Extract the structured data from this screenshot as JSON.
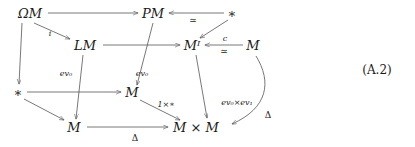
{
  "figure": {
    "kind": "commutative-diagram",
    "equation_number": "(A.2)",
    "nodes": [
      {
        "id": "omega-m",
        "label": "ΩM",
        "x": 30,
        "y": 13
      },
      {
        "id": "pm",
        "label": "PM",
        "x": 153,
        "y": 13
      },
      {
        "id": "star-top",
        "label": "∗",
        "x": 232,
        "y": 13
      },
      {
        "id": "lm",
        "label": "LM",
        "x": 85,
        "y": 45
      },
      {
        "id": "mi",
        "label": "Mᴵ",
        "x": 192,
        "y": 45
      },
      {
        "id": "m-right",
        "label": "M",
        "x": 253,
        "y": 45
      },
      {
        "id": "star-left",
        "label": "∗",
        "x": 18,
        "y": 92
      },
      {
        "id": "m-mid",
        "label": "M",
        "x": 132,
        "y": 92
      },
      {
        "id": "m-bottom",
        "label": "M",
        "x": 74,
        "y": 127
      },
      {
        "id": "m-times-m",
        "label": "M × M",
        "x": 196,
        "y": 127
      }
    ],
    "edge_labels": [
      {
        "id": "i",
        "text": "i",
        "x": 50,
        "y": 34
      },
      {
        "id": "simeq-top",
        "text": "≃",
        "x": 193,
        "y": 20
      },
      {
        "id": "c",
        "text": "c",
        "x": 225,
        "y": 39
      },
      {
        "id": "simeq-c",
        "text": "≃",
        "x": 224,
        "y": 51
      },
      {
        "id": "ev0-left",
        "text": "ev₀",
        "x": 66,
        "y": 74
      },
      {
        "id": "ev0-mid",
        "text": "ev₀",
        "x": 142,
        "y": 74
      },
      {
        "id": "one-times-star",
        "text": "1×∗",
        "x": 166,
        "y": 105
      },
      {
        "id": "ev0-ev1",
        "text": "ev₀×ev₁",
        "x": 237,
        "y": 103
      },
      {
        "id": "delta-right",
        "text": "Δ",
        "x": 268,
        "y": 115
      },
      {
        "id": "delta-bottom",
        "text": "Δ",
        "x": 135,
        "y": 138
      }
    ],
    "edges": [
      {
        "id": "omega-m-to-pm",
        "from": "omega-m",
        "to": "pm",
        "label": null
      },
      {
        "id": "star-top-to-pm",
        "from": "star-top",
        "to": "pm",
        "label": "simeq-top"
      },
      {
        "id": "omega-m-to-lm",
        "from": "omega-m",
        "to": "lm",
        "label": "i"
      },
      {
        "id": "omega-m-to-star-left",
        "from": "omega-m",
        "to": "star-left",
        "label": null
      },
      {
        "id": "pm-to-m-mid",
        "from": "pm",
        "to": "m-mid",
        "label": "ev0-mid"
      },
      {
        "id": "star-top-to-mi",
        "from": "star-top",
        "to": "mi",
        "label": null
      },
      {
        "id": "lm-to-mi",
        "from": "lm",
        "to": "mi",
        "label": null
      },
      {
        "id": "m-right-to-mi",
        "from": "m-right",
        "to": "mi",
        "label": "c"
      },
      {
        "id": "lm-to-m-bottom",
        "from": "lm",
        "to": "m-bottom",
        "label": "ev0-left"
      },
      {
        "id": "star-left-to-m-mid",
        "from": "star-left",
        "to": "m-mid",
        "label": null
      },
      {
        "id": "star-left-to-m-bottom",
        "from": "star-left",
        "to": "m-bottom",
        "label": null
      },
      {
        "id": "m-mid-to-m-times-m",
        "from": "m-mid",
        "to": "m-times-m",
        "label": "one-times-star"
      },
      {
        "id": "mi-to-m-times-m",
        "from": "mi",
        "to": "m-times-m",
        "label": "ev0-ev1"
      },
      {
        "id": "m-right-to-m-times-m",
        "from": "m-right",
        "to": "m-times-m",
        "label": "delta-right"
      },
      {
        "id": "m-bottom-to-m-times-m",
        "from": "m-bottom",
        "to": "m-times-m",
        "label": "delta-bottom"
      }
    ],
    "colors": {
      "ink": "#1a1a1a",
      "stroke": "#555555",
      "background": "#ffffff"
    }
  }
}
